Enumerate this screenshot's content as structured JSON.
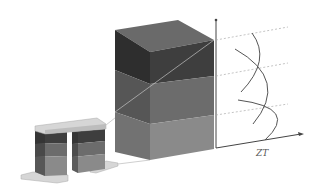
{
  "diagram": {
    "type": "thermoelectric-segmented-leg",
    "axis_label": "ZT",
    "colors": {
      "top_face": "#6a6a6a",
      "segment_dark_front": "#3e3e3e",
      "segment_dark_side": "#2e2e2e",
      "segment_mid_front": "#6c6c6c",
      "segment_mid_side": "#565656",
      "segment_light_front": "#8a8a8a",
      "segment_light_side": "#727272",
      "plate": "#d6d6d6",
      "plate_edge": "#a8a8a8",
      "axis": "#444444",
      "guide": "#aaaaaa",
      "curve": "#555555",
      "connector": "#cfcfcf"
    },
    "segments": [
      "top segment (dark)",
      "middle segment (medium)",
      "bottom segment (light)"
    ],
    "curves": 3
  }
}
